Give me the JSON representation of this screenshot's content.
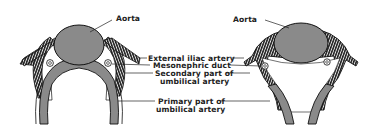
{
  "figure": {
    "left_panel": {
      "aorta_label": "Aorta"
    },
    "right_panel": {
      "aorta_label": "Aorta"
    },
    "center_labels": [
      {
        "id": "external-iliac",
        "lines": [
          "External iliac artery"
        ]
      },
      {
        "id": "mesonephric-duct",
        "lines": [
          "Mesonephric duct"
        ]
      },
      {
        "id": "secondary-umbilical",
        "lines": [
          "Secondary part of",
          "umbilical artery"
        ]
      },
      {
        "id": "primary-umbilical",
        "lines": [
          "Primary part of",
          "umbilical artery"
        ]
      }
    ],
    "colors": {
      "vessel_fill": "#8a8a8a",
      "hatch_dark": "#1e1e1e",
      "outline": "#111111",
      "background": "#ffffff"
    }
  }
}
